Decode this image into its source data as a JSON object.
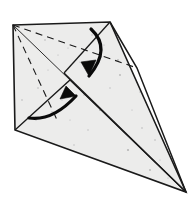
{
  "figure": {
    "type": "origami-diagram",
    "canvas": {
      "width": 190,
      "height": 208,
      "background": "#ffffff"
    },
    "paper": {
      "fill": "#ececeb",
      "stroke": "#1a1a1a",
      "speckle_color": "#8d8d8d",
      "label": "paper-sheet"
    },
    "vertices": {
      "top_left": [
        13,
        25
      ],
      "top_apex": [
        110,
        22
      ],
      "right_bend": [
        137,
        68
      ],
      "bottom_left": [
        15,
        130
      ],
      "bottom_point": [
        186,
        192
      ],
      "center_cross": [
        64,
        73
      ],
      "inner_notch": [
        70,
        80
      ]
    },
    "outline_path": "M13,25 L110,22 L186,192 L15,130 Z",
    "shapes": [
      {
        "name": "main-outline",
        "kind": "solid-edge",
        "d": "M13,25 L110,22 L186,192 L15,130 Z",
        "stroke": "#1a1a1a",
        "width": 1.6
      },
      {
        "name": "right-edge-bend",
        "kind": "solid-edge",
        "d": "M110,22 L137,68 L186,192",
        "stroke": "#1a1a1a",
        "width": 1.5
      },
      {
        "name": "main-diagonal-crease",
        "kind": "solid-crease",
        "d": "M13,25 L186,192",
        "stroke": "#2b2b2b",
        "width": 1.0
      },
      {
        "name": "flap-edge-upper",
        "kind": "solid-crease",
        "d": "M110,22 L64,73",
        "stroke": "#1a1a1a",
        "width": 1.3
      },
      {
        "name": "flap-edge-lower",
        "kind": "solid-crease",
        "d": "M64,73 L186,192",
        "stroke": "#1a1a1a",
        "width": 1.3
      },
      {
        "name": "inner-flap-fold",
        "kind": "solid-crease",
        "d": "M15,130 L70,80 L186,192",
        "stroke": "#1a1a1a",
        "width": 1.3
      },
      {
        "name": "horizontal-valley-fold",
        "kind": "dashed-crease",
        "d": "M13,25 L137,68",
        "stroke": "#1a1a1a",
        "width": 1.1,
        "dash": "7 5"
      },
      {
        "name": "left-diagonal-valley-fold",
        "kind": "dashed-crease",
        "d": "M13,25 L58,122",
        "stroke": "#1a1a1a",
        "width": 1.1,
        "dash": "7 5"
      }
    ],
    "arrows": [
      {
        "name": "fold-down-arrow",
        "direction": "down",
        "label": "fold top flap downward",
        "path": "M91,29 C105,42 104,58 89,76",
        "head": "M89,76 L96,60 L81,62 Z",
        "stroke": "#0a0a0a",
        "width": 3.2
      },
      {
        "name": "fold-up-arrow",
        "direction": "up-right",
        "label": "fold lower flap upward to the right",
        "path": "M29,118 C48,121 63,110 76,96",
        "head": "M76,96 L60,99 L66,86 Z",
        "stroke": "#0a0a0a",
        "width": 3.2
      }
    ],
    "speckles": [
      [
        45,
        40
      ],
      [
        68,
        48
      ],
      [
        92,
        35
      ],
      [
        118,
        60
      ],
      [
        140,
        92
      ],
      [
        100,
        110
      ],
      [
        62,
        100
      ],
      [
        38,
        88
      ],
      [
        30,
        60
      ],
      [
        80,
        62
      ],
      [
        155,
        140
      ],
      [
        128,
        150
      ],
      [
        96,
        165
      ],
      [
        70,
        120
      ],
      [
        52,
        112
      ],
      [
        110,
        88
      ],
      [
        132,
        110
      ],
      [
        150,
        170
      ],
      [
        88,
        130
      ],
      [
        48,
        70
      ],
      [
        22,
        100
      ],
      [
        160,
        160
      ],
      [
        74,
        145
      ],
      [
        104,
        45
      ],
      [
        120,
        75
      ],
      [
        58,
        55
      ],
      [
        36,
        120
      ],
      [
        142,
        128
      ],
      [
        168,
        178
      ],
      [
        84,
        95
      ]
    ]
  }
}
